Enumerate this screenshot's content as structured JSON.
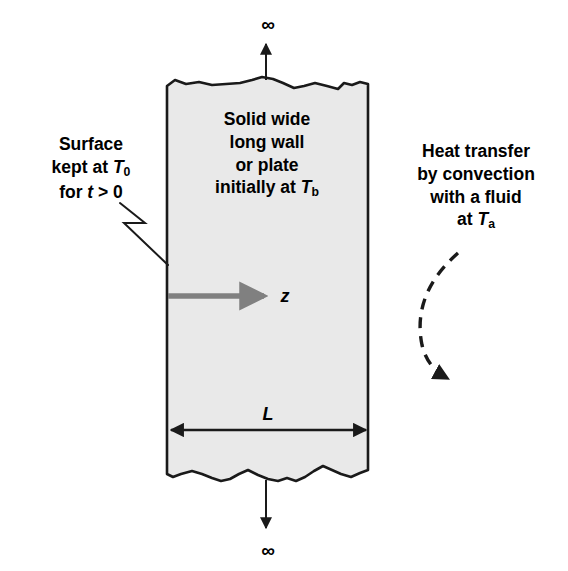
{
  "figure": {
    "domain": "diagram",
    "background_color": "#ffffff",
    "line_color": "#1a1a1a",
    "slab_fill_color": "#e9e9e9",
    "axis_arrow_color": "#808080"
  },
  "slab": {
    "name": "solid-plate",
    "center_label": {
      "line1": "Solid wide",
      "line2": "long wall",
      "line3": "or plate",
      "line4_prefix": "initially at ",
      "line4_symbol": "T",
      "line4_subscript": "b"
    },
    "left_edge_x": 167,
    "right_edge_x": 368,
    "top_y": 78,
    "bottom_y": 478
  },
  "left_label": {
    "name": "surface-boundary-condition",
    "line1": "Surface",
    "line2_prefix": "kept at ",
    "line2_symbol": "T",
    "line2_subscript": "0",
    "line3_prefix": "for ",
    "line3_symbol": "t",
    "line3_suffix": " > 0"
  },
  "right_label": {
    "name": "convection-boundary-condition",
    "line1": "Heat transfer",
    "line2": "by convection",
    "line3": "with a fluid",
    "line4_prefix": "at ",
    "line4_symbol": "T",
    "line4_subscript": "a"
  },
  "annotations": {
    "infinity_top": "∞",
    "infinity_bottom": "∞",
    "axis_label": "z",
    "thickness_label": "L"
  },
  "elements": [
    {
      "name": "infinity-arrow-top",
      "kind": "arrow",
      "direction": "up"
    },
    {
      "name": "infinity-arrow-bottom",
      "kind": "arrow",
      "direction": "down"
    },
    {
      "name": "z-axis-arrow",
      "kind": "arrow",
      "direction": "right",
      "color": "#808080"
    },
    {
      "name": "thickness-dimension",
      "kind": "double-arrow",
      "direction": "horizontal"
    },
    {
      "name": "surface-leader-line",
      "kind": "zigzag-leader"
    },
    {
      "name": "convection-arrow",
      "kind": "curved-dashed-arrow"
    }
  ]
}
